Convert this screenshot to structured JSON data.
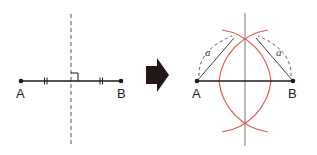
{
  "left_figure": {
    "point_a_label": "A",
    "point_b_label": "B",
    "description": "Segment AB with dashed perpendicular bisector, equal-length tick marks and right-angle mark"
  },
  "arrow": {
    "direction": "right",
    "color": "#231815"
  },
  "right_figure": {
    "point_a_label": "A",
    "point_b_label": "B",
    "radius_label_left": "a",
    "radius_label_right": "a",
    "description": "Compass construction: arcs of equal radius a from A and B intersecting above and below AB; line through intersections is the perpendicular bisector"
  },
  "colors": {
    "line": "#231815",
    "guide": "#777777",
    "arc": "#e8554e",
    "dashed": "#555555"
  }
}
